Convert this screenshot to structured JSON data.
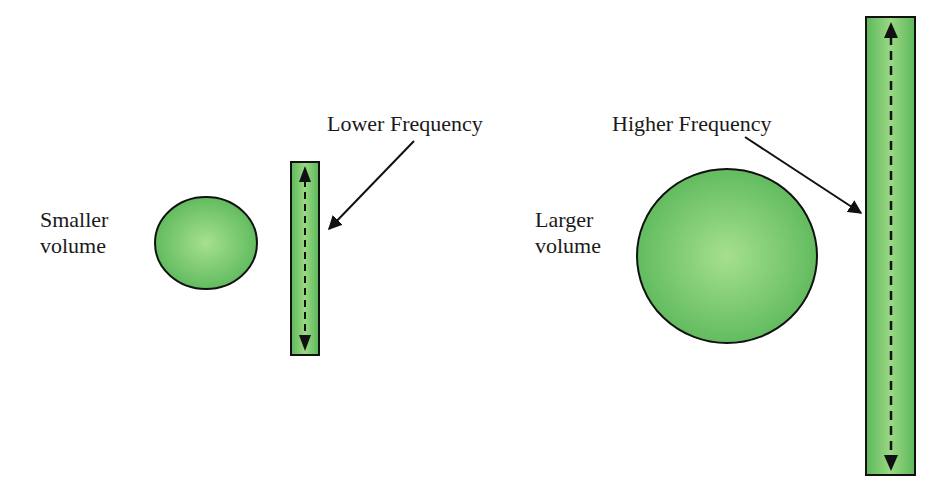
{
  "diagram": {
    "left_panel": {
      "volume_label_line1": "Smaller",
      "volume_label_line2": "volume",
      "frequency_label": "Lower Frequency"
    },
    "right_panel": {
      "volume_label_line1": "Larger",
      "volume_label_line2": "volume",
      "frequency_label": "Higher Frequency"
    },
    "colors": {
      "fill_light": "#a6e08f",
      "fill_dark": "#5cb85a",
      "stroke": "#111111",
      "text": "#1a1a1a"
    }
  }
}
